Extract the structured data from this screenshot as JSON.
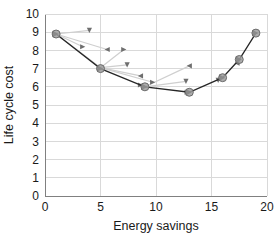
{
  "chart_data": {
    "type": "line",
    "title": "",
    "xlabel": "Energy savings",
    "ylabel": "Life cycle cost",
    "xlim": [
      0,
      20
    ],
    "ylim": [
      0,
      10
    ],
    "xticks": [
      0,
      5,
      10,
      15,
      20
    ],
    "yticks": [
      0,
      1,
      2,
      3,
      4,
      5,
      6,
      7,
      8,
      9,
      10
    ],
    "xticklabels": [
      "0",
      "5",
      "10",
      "15",
      "20"
    ],
    "yticklabels": [
      "0",
      "1",
      "2",
      "3",
      "4",
      "5",
      "6",
      "7",
      "8",
      "9",
      "10"
    ],
    "grid": "horizontal-and-vertical",
    "legend": "none",
    "series": [
      {
        "name": "optimal-front",
        "marker": "circle",
        "color": "#8c8c8c",
        "line_color": "#262626",
        "points": [
          {
            "x": 1.0,
            "y": 8.9
          },
          {
            "x": 5.0,
            "y": 7.0
          },
          {
            "x": 9.0,
            "y": 6.0
          },
          {
            "x": 13.0,
            "y": 5.7
          },
          {
            "x": 16.0,
            "y": 6.5
          },
          {
            "x": 17.5,
            "y": 7.5
          },
          {
            "x": 19.0,
            "y": 8.95
          }
        ]
      },
      {
        "name": "intermediate-solutions",
        "marker": "triangle",
        "color": "#595959",
        "line_color": "#cccccc",
        "points": [
          {
            "x": 3.4,
            "y": 8.2
          },
          {
            "x": 4.0,
            "y": 9.1
          },
          {
            "x": 5.6,
            "y": 8.05
          },
          {
            "x": 7.1,
            "y": 8.05
          },
          {
            "x": 7.4,
            "y": 7.2
          },
          {
            "x": 8.6,
            "y": 6.6
          },
          {
            "x": 9.7,
            "y": 6.25
          },
          {
            "x": 12.7,
            "y": 6.3
          },
          {
            "x": 13.0,
            "y": 7.15
          },
          {
            "x": 8.6,
            "y": 6.1
          },
          {
            "x": 15.6,
            "y": 6.35
          },
          {
            "x": 17.3,
            "y": 7.3
          },
          {
            "x": 12.8,
            "y": 5.7
          }
        ],
        "paths": [
          [
            {
              "x": 1.0,
              "y": 8.9
            },
            {
              "x": 4.0,
              "y": 9.1
            }
          ],
          [
            {
              "x": 1.0,
              "y": 8.9
            },
            {
              "x": 5.6,
              "y": 8.05
            }
          ],
          [
            {
              "x": 1.0,
              "y": 8.9
            },
            {
              "x": 3.4,
              "y": 8.2
            }
          ],
          [
            {
              "x": 1.0,
              "y": 8.9
            },
            {
              "x": 5.0,
              "y": 7.05
            }
          ],
          [
            {
              "x": 5.0,
              "y": 7.05
            },
            {
              "x": 7.1,
              "y": 8.05
            }
          ],
          [
            {
              "x": 5.0,
              "y": 7.05
            },
            {
              "x": 7.4,
              "y": 7.2
            }
          ],
          [
            {
              "x": 5.0,
              "y": 7.05
            },
            {
              "x": 8.6,
              "y": 6.6
            }
          ],
          [
            {
              "x": 5.0,
              "y": 7.05
            },
            {
              "x": 9.7,
              "y": 6.25
            }
          ],
          [
            {
              "x": 9.0,
              "y": 6.0
            },
            {
              "x": 13.0,
              "y": 7.15
            }
          ],
          [
            {
              "x": 9.0,
              "y": 6.0
            },
            {
              "x": 12.7,
              "y": 6.3
            }
          ]
        ]
      }
    ]
  },
  "axis": {
    "x_title": "Energy savings",
    "y_title": "Life cycle cost"
  },
  "colors": {
    "grid": "#d9d9d9",
    "axis": "#808080",
    "main_line": "#262626",
    "main_marker_fill": "#9e9e9e",
    "main_marker_edge": "#6b6b6b",
    "ghost_line": "#cfcfcf",
    "ghost_marker": "#6e6e6e",
    "text": "#1a1a1a",
    "background": "#ffffff"
  }
}
